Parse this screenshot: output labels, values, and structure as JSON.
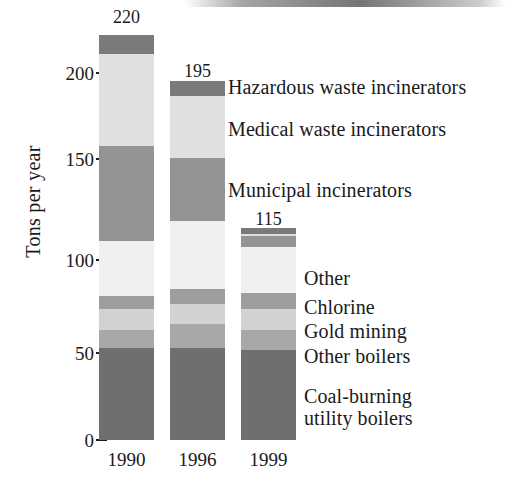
{
  "chart_data": {
    "type": "bar",
    "subtype": "stacked-bar",
    "title": "",
    "xlabel": "",
    "ylabel": "Tons per year",
    "categories": [
      "1990",
      "1996",
      "1999"
    ],
    "ylim": [
      0,
      220
    ],
    "yticks": [
      0,
      50,
      100,
      150,
      200
    ],
    "ytick_labels": [
      "0",
      "50",
      "100",
      "150",
      "200"
    ],
    "grid": false,
    "legend_position": "right",
    "bar_totals": [
      220,
      195,
      115
    ],
    "bar_total_labels": [
      "220",
      "195",
      "115"
    ],
    "series": [
      {
        "name": "Hazardous waste incinerators",
        "color": "#7a7a7a",
        "values": [
          10,
          8,
          3
        ]
      },
      {
        "name": "Medical waste incinerators",
        "color": "#e0e0e0",
        "values": [
          50,
          34,
          1
        ]
      },
      {
        "name": "Municipal incinerators",
        "color": "#949494",
        "values": [
          52,
          34,
          6
        ]
      },
      {
        "name": "Other",
        "color": "#f0f0f0",
        "values": [
          30,
          37,
          25
        ]
      },
      {
        "name": "Chlorine",
        "color": "#9e9e9e",
        "values": [
          7,
          8,
          9
        ]
      },
      {
        "name": "Gold mining",
        "color": "#d2d2d2",
        "values": [
          11,
          11,
          11
        ]
      },
      {
        "name": "Other boilers",
        "color": "#a8a8a8",
        "values": [
          10,
          13,
          11
        ]
      },
      {
        "name": "Coal-burning utility boilers",
        "color": "#6f6f6f",
        "values": [
          50,
          50,
          49
        ]
      }
    ]
  },
  "axis": {
    "y_title": "Tons per year",
    "ticks": [
      {
        "label": "200",
        "value": 200
      },
      {
        "label": "150",
        "value": 150
      },
      {
        "label": "100",
        "value": 100
      },
      {
        "label": "50",
        "value": 50
      },
      {
        "label": "0",
        "value": 0
      }
    ]
  },
  "bars": [
    {
      "year": "1990",
      "total_label": "220"
    },
    {
      "year": "1996",
      "total_label": "195"
    },
    {
      "year": "1999",
      "total_label": "115"
    }
  ],
  "legend": {
    "items": [
      {
        "label": "Hazardous waste incinerators"
      },
      {
        "label": "Medical waste incinerators"
      },
      {
        "label": "Municipal incinerators"
      },
      {
        "label": "Other"
      },
      {
        "label": "Chlorine"
      },
      {
        "label": "Gold mining"
      },
      {
        "label": "Other boilers"
      },
      {
        "label": "Coal-burning",
        "label2": "utility boilers"
      }
    ]
  }
}
